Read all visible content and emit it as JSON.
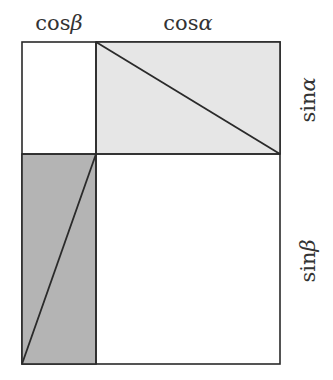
{
  "diagram": {
    "title": "",
    "type": "trigonometric-area-proof",
    "labels": {
      "top_left": {
        "func": "cos",
        "angle": "β"
      },
      "top_right": {
        "func": "cos",
        "angle": "α"
      },
      "right_top": {
        "func": "sin",
        "angle": "α"
      },
      "right_bottom": {
        "func": "sin",
        "angle": "β"
      }
    },
    "colors": {
      "stroke": "#2a2a2a",
      "light_fill": "#e6e6e6",
      "dark_fill": "#b4b4b4",
      "background": "#ffffff",
      "text": "#333333"
    },
    "geometry": {
      "outer_rect": {
        "x": 22,
        "y": 42,
        "width": 258,
        "height": 322
      },
      "vertical_divider_x": 96,
      "horizontal_divider_y": 154,
      "light_rect": {
        "x": 96,
        "y": 42,
        "width": 184,
        "height": 112
      },
      "dark_rect": {
        "x": 22,
        "y": 154,
        "width": 74,
        "height": 210
      },
      "light_diagonal": {
        "x1": 96,
        "y1": 42,
        "x2": 280,
        "y2": 154
      },
      "dark_diagonal": {
        "x1": 22,
        "y1": 364,
        "x2": 96,
        "y2": 154
      }
    }
  }
}
